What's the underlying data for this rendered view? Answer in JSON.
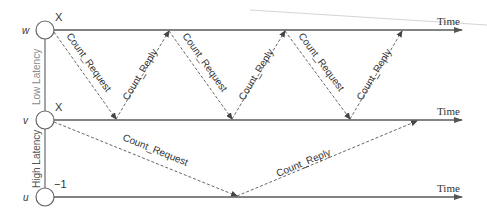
{
  "diagram": {
    "colors": {
      "line": "#5a5a5a",
      "text": "#333333",
      "faint": "#cfcfcf",
      "latency_label": "#888888"
    },
    "nodes": [
      {
        "id": "w",
        "label": "w",
        "value": "X",
        "y": 30
      },
      {
        "id": "v",
        "label": "v",
        "value": "X",
        "y": 120
      },
      {
        "id": "u",
        "label": "u",
        "value": "−1",
        "y": 197
      }
    ],
    "timelines": [
      {
        "node": "w",
        "label": "Time"
      },
      {
        "node": "v",
        "label": "Time"
      },
      {
        "node": "u",
        "label": "Time"
      }
    ],
    "latency_labels": {
      "low": "Low Latency",
      "high": "High Latency"
    },
    "messages": [
      {
        "label": "Count_Request",
        "from": "w",
        "to": "v",
        "x1": 54,
        "x2": 116
      },
      {
        "label": "Count_Reply",
        "from": "v",
        "to": "w",
        "x1": 116,
        "x2": 169
      },
      {
        "label": "Count_Request",
        "from": "w",
        "to": "v",
        "x1": 169,
        "x2": 232
      },
      {
        "label": "Count_Reply",
        "from": "v",
        "to": "w",
        "x1": 232,
        "x2": 285
      },
      {
        "label": "Count_Request",
        "from": "w",
        "to": "v",
        "x1": 285,
        "x2": 350
      },
      {
        "label": "Count_Reply",
        "from": "v",
        "to": "w",
        "x1": 350,
        "x2": 402
      },
      {
        "label": "Count_Request",
        "from": "v",
        "to": "u",
        "x1": 54,
        "x2": 237
      },
      {
        "label": "Count_Reply",
        "from": "u",
        "to": "v",
        "x1": 237,
        "x2": 417
      }
    ]
  }
}
